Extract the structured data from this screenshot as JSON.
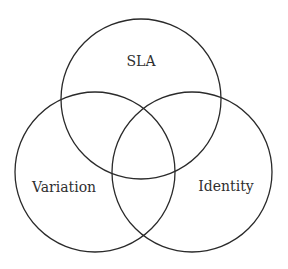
{
  "diagram": {
    "type": "venn",
    "sets": [
      {
        "label": "SLA",
        "cx": 141,
        "cy": 99,
        "r": 80
      },
      {
        "label": "Variation",
        "cx": 95,
        "cy": 172,
        "r": 80
      },
      {
        "label": "Identity",
        "cx": 192,
        "cy": 172,
        "r": 80
      }
    ],
    "colors": {
      "stroke": "#2a2a2a",
      "text": "#2f2f2f",
      "background": "#ffffff"
    }
  }
}
